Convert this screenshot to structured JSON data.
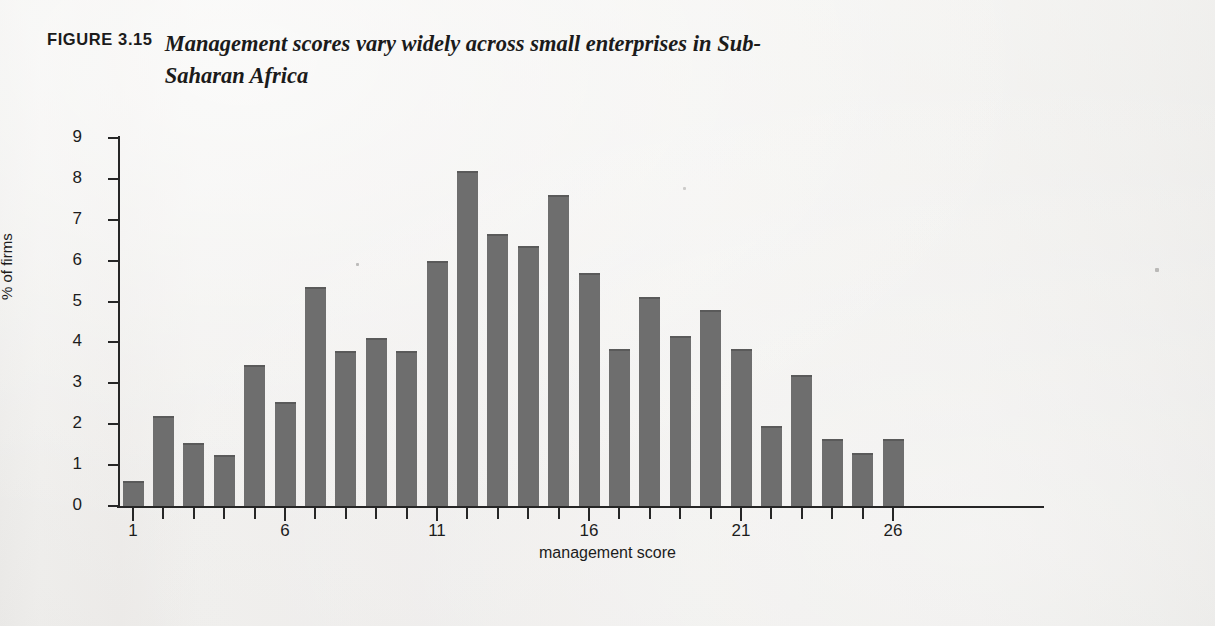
{
  "figure": {
    "number_label": "FIGURE 3.15",
    "title": "Management scores vary widely across small enterprises in Sub-Saharan Africa"
  },
  "chart_data": {
    "type": "bar",
    "title": "Management scores vary widely across small enterprises in Sub-Saharan Africa",
    "xlabel": "management score",
    "ylabel": "% of firms",
    "xlim": [
      0.5,
      26.5
    ],
    "ylim": [
      0,
      9
    ],
    "grid": false,
    "legend": "none",
    "bar_color": "#6e6e6e",
    "categories": [
      1,
      2,
      3,
      4,
      5,
      6,
      7,
      8,
      9,
      10,
      11,
      12,
      13,
      14,
      15,
      16,
      17,
      18,
      19,
      20,
      21,
      22,
      23,
      24,
      25,
      26
    ],
    "values": [
      0.6,
      2.2,
      1.55,
      1.25,
      3.45,
      2.55,
      5.35,
      3.8,
      4.1,
      3.8,
      6.0,
      8.2,
      6.65,
      6.35,
      7.6,
      5.7,
      3.85,
      5.1,
      4.15,
      4.8,
      3.85,
      1.95,
      3.2,
      1.65,
      1.3,
      1.65
    ],
    "y_ticks": [
      0,
      1,
      2,
      3,
      4,
      5,
      6,
      7,
      8,
      9
    ],
    "y_tick_labels": [
      "0",
      "1",
      "2",
      "3",
      "4",
      "5",
      "6",
      "7",
      "8",
      "9"
    ],
    "x_ticks_major": [
      1,
      6,
      11,
      16,
      21,
      26
    ],
    "x_tick_labels_major": [
      "1",
      "6",
      "11",
      "16",
      "21",
      "26"
    ],
    "x_ticks_minor": [
      2,
      3,
      4,
      5,
      7,
      8,
      9,
      10,
      12,
      13,
      14,
      15,
      17,
      18,
      19,
      20,
      22,
      23,
      24,
      25
    ]
  }
}
